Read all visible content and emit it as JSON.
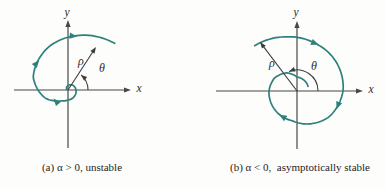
{
  "figure": {
    "background": "#fdfdfc",
    "spiral_color": "#2e817a",
    "axis_color": "#474747",
    "annotation_color": "#3c3c3c",
    "panels": [
      {
        "id": "a",
        "caption": "(a) α > 0, unstable",
        "caption_center_x": 82,
        "caption_top": 162,
        "axis_labels": {
          "x": "x",
          "y": "y"
        },
        "origin": {
          "x": 68,
          "y": 90
        },
        "x_axis": {
          "from": 14,
          "to": 128,
          "tip": 131,
          "label_x": 139,
          "label_y": 89
        },
        "y_axis": {
          "from": 148,
          "to": 23,
          "tip": 20,
          "label_x": 67,
          "label_y": 13
        },
        "rho": {
          "label": "ρ",
          "tip_x": 96,
          "tip_y": 47,
          "label_x": 81,
          "label_y": 61
        },
        "theta": {
          "label": "θ",
          "radius": 20,
          "start_deg": 0,
          "end_deg": 49,
          "label_x": 102,
          "label_y": 68
        },
        "spiral": {
          "direction": "clockwise-outward",
          "points_deg_r": [
            [
              45,
              66
            ],
            [
              85,
              54
            ],
            [
              115,
              47
            ],
            [
              140,
              41
            ],
            [
              160,
              37
            ],
            [
              180,
              30
            ],
            [
              200,
              24
            ],
            [
              220,
              17
            ],
            [
              240,
              12.5
            ],
            [
              270,
              10
            ],
            [
              315,
              9
            ],
            [
              360,
              8
            ],
            [
              400,
              7
            ],
            [
              440,
              5
            ],
            [
              480,
              3
            ],
            [
              510,
              1.5
            ]
          ],
          "arrowheads_deg": [
            84,
            139,
            222
          ]
        }
      },
      {
        "id": "b",
        "caption": "(b) α < 0,  asymptotically stable",
        "caption_center_x": 107,
        "caption_top": 162,
        "axis_labels": {
          "x": "x",
          "y": "y"
        },
        "origin": {
          "x": 104,
          "y": 91
        },
        "x_axis": {
          "from": 23,
          "to": 167,
          "tip": 170,
          "label_x": 178,
          "label_y": 90
        },
        "y_axis": {
          "from": 149,
          "to": 24,
          "tip": 21,
          "label_x": 103,
          "label_y": 13
        },
        "rho": {
          "label": "ρ",
          "tip_x": 67,
          "tip_y": 42,
          "label_x": 79,
          "label_y": 63
        },
        "theta": {
          "label": "θ",
          "radius": 21,
          "start_deg": 0,
          "end_deg": 112,
          "label_x": 121,
          "label_y": 66
        },
        "spiral": {
          "direction": "clockwise-inward",
          "points_deg_r": [
            [
              133,
              62
            ],
            [
              100,
              55
            ],
            [
              69,
              51
            ],
            [
              40,
              49
            ],
            [
              0,
              46
            ],
            [
              -40,
              41
            ],
            [
              -70,
              35
            ],
            [
              -100,
              30
            ],
            [
              -140,
              29
            ],
            [
              -180,
              28
            ],
            [
              -210,
              26
            ],
            [
              -240,
              21
            ],
            [
              -270,
              14
            ],
            [
              -300,
              13
            ],
            [
              -337,
              12
            ]
          ],
          "arrowheads_deg": [
            69,
            -20,
            -120
          ]
        }
      }
    ]
  }
}
